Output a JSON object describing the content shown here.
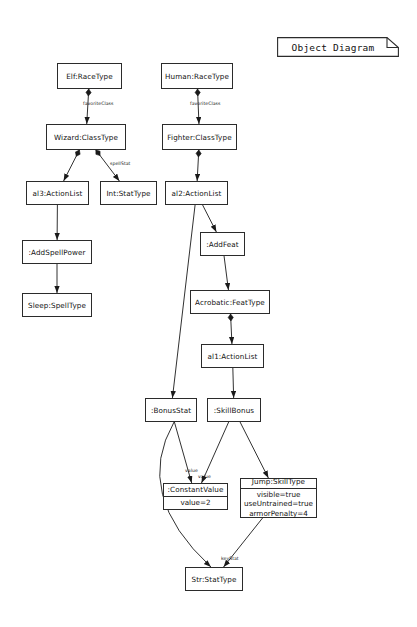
{
  "diagram": {
    "title": "Object Diagram",
    "type": "UML Object Diagram",
    "nodes": [
      {
        "id": "elf",
        "label": "Elf:RaceType",
        "x": 57,
        "y": 63,
        "w": 65,
        "h": 26,
        "attributes": []
      },
      {
        "id": "human",
        "label": "Human:RaceType",
        "x": 161,
        "y": 63,
        "w": 72,
        "h": 26,
        "attributes": []
      },
      {
        "id": "wizard",
        "label": "Wizard:ClassType",
        "x": 46,
        "y": 124,
        "w": 80,
        "h": 26,
        "attributes": []
      },
      {
        "id": "fighter",
        "label": "Fighter:ClassType",
        "x": 162,
        "y": 124,
        "w": 75,
        "h": 26,
        "attributes": []
      },
      {
        "id": "al3",
        "label": "al3:ActionList",
        "x": 26,
        "y": 181,
        "w": 63,
        "h": 24,
        "attributes": []
      },
      {
        "id": "int",
        "label": "Int:StatType",
        "x": 100,
        "y": 181,
        "w": 57,
        "h": 24,
        "attributes": []
      },
      {
        "id": "al2",
        "label": "al2:ActionList",
        "x": 165,
        "y": 181,
        "w": 63,
        "h": 24,
        "attributes": []
      },
      {
        "id": "addspell",
        "label": ":AddSpellPower",
        "x": 22,
        "y": 240,
        "w": 70,
        "h": 24,
        "attributes": []
      },
      {
        "id": "addfeat",
        "label": ":AddFeat",
        "x": 200,
        "y": 232,
        "w": 45,
        "h": 24,
        "attributes": []
      },
      {
        "id": "sleep",
        "label": "Sleep:SpellType",
        "x": 22,
        "y": 293,
        "w": 70,
        "h": 24,
        "attributes": []
      },
      {
        "id": "acrobatic",
        "label": "Acrobatic:FeatType",
        "x": 190,
        "y": 290,
        "w": 80,
        "h": 24,
        "attributes": []
      },
      {
        "id": "al1",
        "label": "al1:ActionList",
        "x": 201,
        "y": 344,
        "w": 63,
        "h": 24,
        "attributes": []
      },
      {
        "id": "bonusstat",
        "label": ":BonusStat",
        "x": 145,
        "y": 398,
        "w": 52,
        "h": 24,
        "attributes": []
      },
      {
        "id": "skillbonus",
        "label": ":SkillBonus",
        "x": 207,
        "y": 398,
        "w": 54,
        "h": 24,
        "attributes": []
      },
      {
        "id": "constval",
        "label": ":ConstantValue",
        "x": 163,
        "y": 483,
        "w": 65,
        "h": 27,
        "attributes": [
          "value=2"
        ]
      },
      {
        "id": "jump",
        "label": "Jump:SkillType",
        "x": 240,
        "y": 478,
        "w": 77,
        "h": 40,
        "attributes": [
          "visible=true",
          "useUntrained=true",
          "armorPenalty=4"
        ]
      },
      {
        "id": "str",
        "label": "Str:StatType",
        "x": 185,
        "y": 567,
        "w": 58,
        "h": 24,
        "attributes": []
      }
    ],
    "edges": [
      {
        "id": "e1",
        "from": "elf",
        "to": "wizard",
        "label": "favoriteClass",
        "source_marker": "filled-diamond"
      },
      {
        "id": "e2",
        "from": "human",
        "to": "fighter",
        "label": "favoriteClass",
        "source_marker": "filled-diamond"
      },
      {
        "id": "e3",
        "from": "wizard",
        "to": "al3",
        "label": "",
        "source_marker": "filled-diamond"
      },
      {
        "id": "e4",
        "from": "wizard",
        "to": "int",
        "label": "spellStat",
        "source_marker": "filled-diamond"
      },
      {
        "id": "e5",
        "from": "fighter",
        "to": "al2",
        "label": "",
        "source_marker": "filled-diamond"
      },
      {
        "id": "e6",
        "from": "al3",
        "to": "addspell",
        "label": "",
        "source_marker": "none"
      },
      {
        "id": "e7",
        "from": "addspell",
        "to": "sleep",
        "label": "",
        "source_marker": "none"
      },
      {
        "id": "e8",
        "from": "al2",
        "to": "addfeat",
        "label": "",
        "source_marker": "none"
      },
      {
        "id": "e9",
        "from": "al2",
        "to": "bonusstat",
        "label": "",
        "source_marker": "none"
      },
      {
        "id": "e10",
        "from": "addfeat",
        "to": "acrobatic",
        "label": "",
        "source_marker": "none"
      },
      {
        "id": "e11",
        "from": "acrobatic",
        "to": "al1",
        "label": "",
        "source_marker": "filled-diamond"
      },
      {
        "id": "e12",
        "from": "al1",
        "to": "skillbonus",
        "label": "",
        "source_marker": "none"
      },
      {
        "id": "e13",
        "from": "bonusstat",
        "to": "constval",
        "label": "value",
        "source_marker": "none"
      },
      {
        "id": "e14",
        "from": "bonusstat",
        "to": "str",
        "label": "",
        "source_marker": "none"
      },
      {
        "id": "e15",
        "from": "skillbonus",
        "to": "constval",
        "label": "value",
        "source_marker": "none"
      },
      {
        "id": "e16",
        "from": "skillbonus",
        "to": "jump",
        "label": "",
        "source_marker": "none"
      },
      {
        "id": "e17",
        "from": "jump",
        "to": "str",
        "label": "keyStat",
        "source_marker": "none"
      }
    ],
    "edge_labels": [
      {
        "id": "l1",
        "text": "favoriteClass",
        "x": 83,
        "y": 101
      },
      {
        "id": "l2",
        "text": "favoriteClass",
        "x": 190,
        "y": 101
      },
      {
        "id": "l3",
        "text": "spellStat",
        "x": 110,
        "y": 161
      },
      {
        "id": "l4",
        "text": "value",
        "x": 185,
        "y": 468
      },
      {
        "id": "l5",
        "text": "value",
        "x": 198,
        "y": 474
      },
      {
        "id": "l6",
        "text": "keyStat",
        "x": 221,
        "y": 556
      }
    ],
    "colors": {
      "stroke": "#2b2b2b",
      "edge": "#1a1a1a",
      "text": "#111111",
      "background": "#ffffff"
    }
  }
}
